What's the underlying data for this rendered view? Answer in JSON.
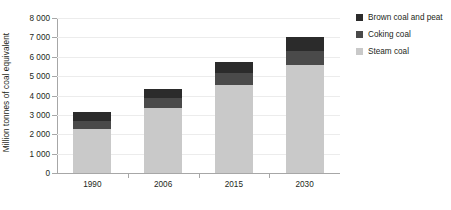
{
  "chart_data": {
    "type": "bar",
    "title": "",
    "subtitle": "",
    "stacked": true,
    "orientation": "vertical",
    "xlabel": "",
    "ylabel": "Million tonnes of coal equivalent",
    "categories": [
      "1990",
      "2006",
      "2015",
      "2030"
    ],
    "ylim": [
      0,
      8000
    ],
    "ytick_step": 1000,
    "ytick_labels": [
      "0",
      "1 000",
      "2 000",
      "3 000",
      "4 000",
      "5 000",
      "6 000",
      "7 000",
      "8 000"
    ],
    "ytick_values": [
      0,
      1000,
      2000,
      3000,
      4000,
      5000,
      6000,
      7000,
      8000
    ],
    "grid": true,
    "grid_axis": "y",
    "legend_position": "right",
    "series": [
      {
        "name": "Steam coal",
        "color": "#c9c9c9",
        "values": [
          2250,
          3350,
          4550,
          5600
        ]
      },
      {
        "name": "Coking coal",
        "color": "#4a4a4a",
        "values": [
          450,
          500,
          600,
          700
        ]
      },
      {
        "name": "Brown coal and peat",
        "color": "#2b2b2b",
        "values": [
          450,
          500,
          600,
          700
        ]
      }
    ],
    "totals": [
      3150,
      4350,
      5750,
      7000
    ]
  },
  "legend": {
    "items": [
      {
        "label": "Brown coal and peat",
        "color": "#2b2b2b"
      },
      {
        "label": "Coking coal",
        "color": "#4a4a4a"
      },
      {
        "label": "Steam coal",
        "color": "#c9c9c9"
      }
    ]
  },
  "axes": {
    "y_title": "Million tonnes of coal equivalent",
    "axis_color": "#a7a7a7",
    "grid_color": "#ececec"
  }
}
